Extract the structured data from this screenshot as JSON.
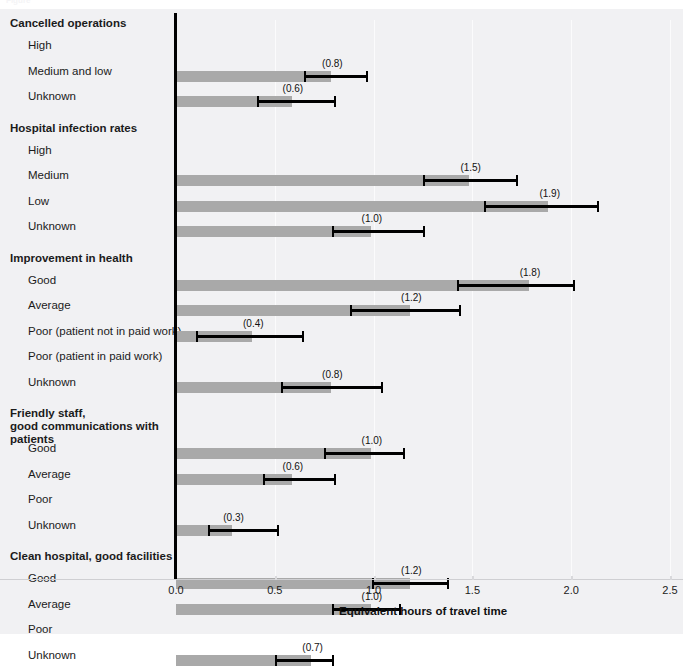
{
  "caption": "Figure",
  "chart_data": {
    "type": "bar",
    "orientation": "horizontal",
    "title": "",
    "xlabel": "Equivalent hours of travel time",
    "ylabel": "",
    "xlim": [
      0.0,
      2.5
    ],
    "xticks": [
      0.0,
      0.5,
      1.0,
      1.5,
      2.0,
      2.5
    ],
    "xticklabels": [
      "0.0",
      "0.5",
      "1.0",
      "1.5",
      "2.0",
      "2.5"
    ],
    "grid": "vertical",
    "legend": "none",
    "bar_color": "#a9a9a9",
    "error_color": "#000000",
    "value_label_format": "(v)",
    "groups": [
      {
        "name": "Cancelled operations",
        "rows": [
          {
            "label": "High",
            "value": null,
            "value_label": "",
            "ci_low": null,
            "ci_high": null
          },
          {
            "label": "Medium and low",
            "value": 0.8,
            "value_label": "(0.8)",
            "ci_low": 0.65,
            "ci_high": 0.97
          },
          {
            "label": "Unknown",
            "value": 0.6,
            "value_label": "(0.6)",
            "ci_low": 0.41,
            "ci_high": 0.81
          }
        ]
      },
      {
        "name": "Hospital infection rates",
        "rows": [
          {
            "label": "High",
            "value": null,
            "value_label": "",
            "ci_low": null,
            "ci_high": null
          },
          {
            "label": "Medium",
            "value": 1.5,
            "value_label": "(1.5)",
            "ci_low": 1.25,
            "ci_high": 1.73
          },
          {
            "label": "Low",
            "value": 1.9,
            "value_label": "(1.9)",
            "ci_low": 1.56,
            "ci_high": 2.14
          },
          {
            "label": "Unknown",
            "value": 1.0,
            "value_label": "(1.0)",
            "ci_low": 0.79,
            "ci_high": 1.26
          }
        ]
      },
      {
        "name": "Improvement in health",
        "rows": [
          {
            "label": "Good",
            "value": 1.8,
            "value_label": "(1.8)",
            "ci_low": 1.42,
            "ci_high": 2.02
          },
          {
            "label": "Average",
            "value": 1.2,
            "value_label": "(1.2)",
            "ci_low": 0.88,
            "ci_high": 1.44
          },
          {
            "label": "Poor (patient not in paid work)",
            "value": 0.4,
            "value_label": "(0.4)",
            "ci_low": 0.1,
            "ci_high": 0.65
          },
          {
            "label": "Poor (patient in paid work)",
            "value": null,
            "value_label": "",
            "ci_low": null,
            "ci_high": null
          },
          {
            "label": "Unknown",
            "value": 0.8,
            "value_label": "(0.8)",
            "ci_low": 0.53,
            "ci_high": 1.05
          }
        ]
      },
      {
        "name": "Friendly staff, good communications with patients",
        "rows": [
          {
            "label": "Good",
            "value": 1.0,
            "value_label": "(1.0)",
            "ci_low": 0.75,
            "ci_high": 1.16
          },
          {
            "label": "Average",
            "value": 0.6,
            "value_label": "(0.6)",
            "ci_low": 0.44,
            "ci_high": 0.81
          },
          {
            "label": "Poor",
            "value": null,
            "value_label": "",
            "ci_low": null,
            "ci_high": null
          },
          {
            "label": "Unknown",
            "value": 0.3,
            "value_label": "(0.3)",
            "ci_low": 0.16,
            "ci_high": 0.52
          }
        ]
      },
      {
        "name": "Clean hospital, good facilities",
        "rows": [
          {
            "label": "Good",
            "value": 1.2,
            "value_label": "(1.2)",
            "ci_low": 0.99,
            "ci_high": 1.38
          },
          {
            "label": "Average",
            "value": 1.0,
            "value_label": "(1.0)",
            "ci_low": 0.79,
            "ci_high": 1.14
          },
          {
            "label": "Poor",
            "value": null,
            "value_label": "",
            "ci_low": null,
            "ci_high": null
          },
          {
            "label": "Unknown",
            "value": 0.7,
            "value_label": "(0.7)",
            "ci_low": 0.5,
            "ci_high": 0.8
          }
        ]
      }
    ]
  }
}
